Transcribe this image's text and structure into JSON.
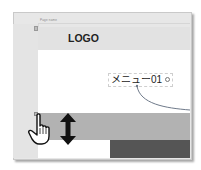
{
  "window": {
    "tab_label": "Page name"
  },
  "header": {
    "logo_text": "LOGO"
  },
  "menu": {
    "item_label": "メニュー01",
    "add_icon": "plus-circle-icon"
  },
  "overlay": {
    "cursor_icon": "hand-pointer-icon",
    "resize_icon": "vertical-resize-arrow-icon"
  },
  "colors": {
    "frame_bg": "#e7e7e7",
    "header_band": "#e2e2e2",
    "gray_band": "#b2b2b2",
    "dark_block": "#555555",
    "curve": "#6f7a8a"
  }
}
